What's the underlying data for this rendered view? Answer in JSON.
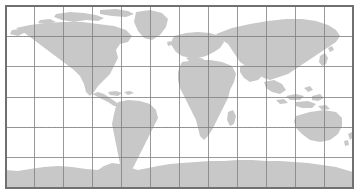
{
  "figure": {
    "type": "world-map",
    "projection": "equirectangular",
    "width": 360,
    "height": 196
  },
  "colors": {
    "background": "#ffffff",
    "ocean": "#ffffff",
    "land": "#c8c8c8",
    "graticule": "#808080",
    "graticule_minor": "#a8a8a8",
    "frame": "#707070"
  },
  "map_frame": {
    "x": 6,
    "y": 6,
    "width": 347,
    "height": 182
  },
  "graticule": {
    "longitude_step_degrees": 30,
    "latitude_step_degrees": 30,
    "longitude_range": [
      -180,
      180
    ],
    "latitude_range": [
      -90,
      90
    ],
    "meridian_count": 13,
    "parallel_count": 7,
    "meridian_x": [
      6,
      34.9,
      63.8,
      92.8,
      121.7,
      150.6,
      179.5,
      208.4,
      237.3,
      266.2,
      295.2,
      324.1,
      353
    ],
    "parallel_y": [
      6,
      36.3,
      66.7,
      97,
      127.3,
      157.7,
      188
    ],
    "minor_parallels": {
      "labels": [
        "Tropic of Cancer",
        "Tropic of Capricorn"
      ],
      "y": [
        36.3,
        127.3
      ],
      "style": "dotted"
    }
  },
  "continents": [
    {
      "name": "north-america",
      "label": "North America"
    },
    {
      "name": "greenland",
      "label": "Greenland"
    },
    {
      "name": "central-america",
      "label": "Central America"
    },
    {
      "name": "south-america",
      "label": "South America"
    },
    {
      "name": "europe",
      "label": "Europe"
    },
    {
      "name": "africa",
      "label": "Africa"
    },
    {
      "name": "asia",
      "label": "Asia"
    },
    {
      "name": "madagascar",
      "label": "Madagascar"
    },
    {
      "name": "southeast-asia-islands",
      "label": "Southeast Asia Islands"
    },
    {
      "name": "australia",
      "label": "Australia"
    },
    {
      "name": "new-zealand",
      "label": "New Zealand"
    },
    {
      "name": "antarctica",
      "label": "Antarctica"
    },
    {
      "name": "arctic-islands",
      "label": "Arctic Islands"
    },
    {
      "name": "british-isles",
      "label": "British Isles"
    },
    {
      "name": "japan",
      "label": "Japan"
    }
  ]
}
